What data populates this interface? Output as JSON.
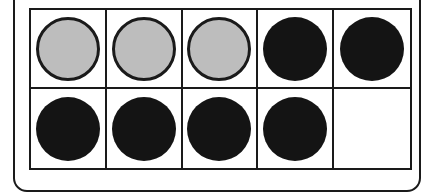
{
  "ten_frame": {
    "rows": 2,
    "columns": 5,
    "cells": [
      {
        "state": "gray"
      },
      {
        "state": "gray"
      },
      {
        "state": "gray"
      },
      {
        "state": "black"
      },
      {
        "state": "black"
      },
      {
        "state": "black"
      },
      {
        "state": "black"
      },
      {
        "state": "black"
      },
      {
        "state": "black"
      },
      {
        "state": "empty"
      }
    ],
    "counts": {
      "gray": 3,
      "black": 6,
      "empty": 1,
      "filled": 9
    }
  },
  "colors": {
    "gray_fill": "#bdbdbd",
    "gray_stroke": "#1a1a1a",
    "black_fill": "#141414",
    "line": "#1a1a1a"
  }
}
